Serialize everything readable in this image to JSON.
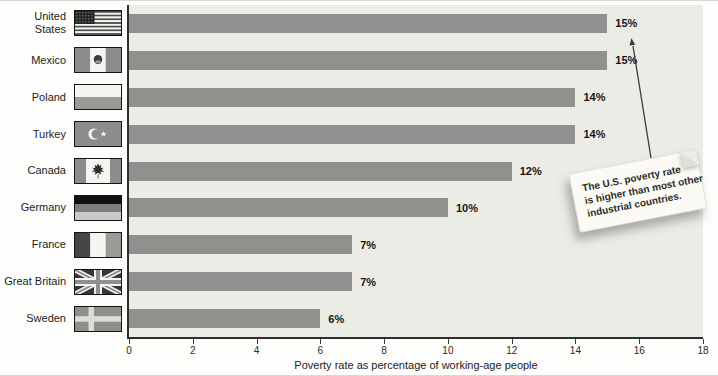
{
  "chart_data": {
    "type": "bar",
    "orientation": "horizontal",
    "title": "",
    "xlabel": "Poverty rate as percentage of working-age people",
    "ylabel": "",
    "xlim": [
      0,
      18
    ],
    "xticks": [
      0,
      2,
      4,
      6,
      8,
      10,
      12,
      14,
      16,
      18
    ],
    "grid": false,
    "legend": null,
    "bar_color": "#8f918e",
    "plot_bg": "#ecece7",
    "categories": [
      "United States",
      "Mexico",
      "Poland",
      "Turkey",
      "Canada",
      "Germany",
      "France",
      "Great Britain",
      "Sweden"
    ],
    "label_lines": [
      [
        "United",
        "States"
      ],
      [
        "Mexico"
      ],
      [
        "Poland"
      ],
      [
        "Turkey"
      ],
      [
        "Canada"
      ],
      [
        "Germany"
      ],
      [
        "France"
      ],
      [
        "Great Britain"
      ],
      [
        "Sweden"
      ]
    ],
    "flags": [
      "us",
      "mx",
      "pl",
      "tr",
      "ca",
      "de",
      "fr",
      "gb",
      "se"
    ],
    "values": [
      15,
      15,
      14,
      14,
      12,
      10,
      7,
      7,
      6
    ],
    "value_labels": [
      "15%",
      "15%",
      "14%",
      "14%",
      "12%",
      "10%",
      "7%",
      "7%",
      "6%"
    ],
    "annotation": {
      "text": "The U.S. poverty rate is higher than most other industrial countries.",
      "lines": [
        "The U.S. poverty rate",
        "is higher than most other",
        "industrial countries."
      ],
      "points_to": "United States bar"
    }
  }
}
